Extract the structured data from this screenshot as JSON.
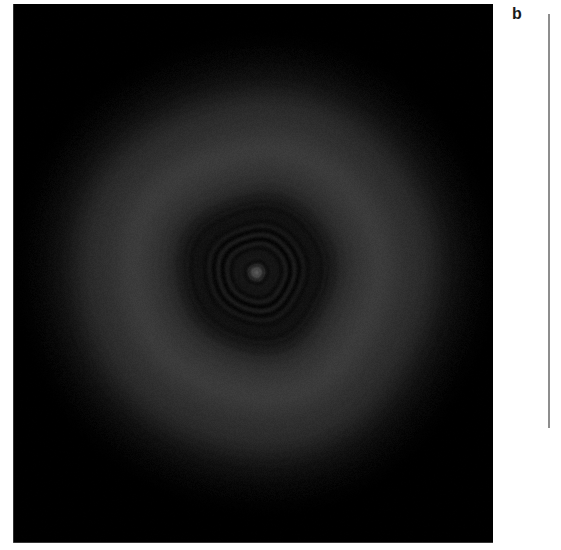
{
  "figure": {
    "panel_letter": "b",
    "caption_text": "",
    "background_color": "#ffffff"
  },
  "image_panel": {
    "name": "diffraction-pattern",
    "background_color": "#000000",
    "x": 13,
    "y": 4,
    "width": 480,
    "height": 539
  },
  "vertical_rule": {
    "color": "#8d8d8d",
    "x": 548,
    "y": 14,
    "width": 2,
    "height": 414
  },
  "chart_data": {
    "type": "heatmap",
    "title": "",
    "subtitle": "",
    "xlabel": "",
    "ylabel": "",
    "annotations": [
      "b"
    ],
    "legend": [],
    "grid": false,
    "colormap": "grayscale",
    "value_range": [
      0,
      255
    ],
    "center": {
      "x": 256,
      "y": 272
    },
    "radial_profile": {
      "radius": [
        0,
        4,
        7,
        10,
        14,
        18,
        22,
        26,
        30,
        34,
        38,
        42,
        46,
        50,
        54,
        58,
        62,
        66,
        70,
        78,
        86,
        94,
        102,
        110,
        118,
        126,
        134,
        142,
        150,
        158,
        166,
        174,
        182,
        190,
        198,
        206,
        214,
        222,
        232,
        245
      ],
      "intensity": [
        78,
        72,
        40,
        16,
        26,
        13,
        24,
        12,
        22,
        11,
        21,
        12,
        20,
        13,
        19,
        14,
        20,
        16,
        22,
        30,
        40,
        48,
        54,
        57,
        58,
        57,
        55,
        53,
        50,
        46,
        41,
        35,
        29,
        23,
        17,
        12,
        8,
        5,
        2,
        0
      ]
    },
    "rings": [
      {
        "name": "central-spot",
        "radius": 6,
        "intensity": 76
      },
      {
        "name": "ring-1",
        "radius": 13,
        "intensity": 27
      },
      {
        "name": "ring-2",
        "radius": 23,
        "intensity": 25
      },
      {
        "name": "ring-3",
        "radius": 33,
        "intensity": 23
      },
      {
        "name": "ring-4",
        "radius": 43,
        "intensity": 21
      },
      {
        "name": "ring-5",
        "radius": 53,
        "intensity": 20
      },
      {
        "name": "ring-6",
        "radius": 63,
        "intensity": 21
      },
      {
        "name": "amorphous-halo",
        "radius": 120,
        "intensity": 58
      },
      {
        "name": "halo-outer-edge",
        "radius": 205,
        "intensity": 4
      }
    ],
    "noise": {
      "type": "grain",
      "amplitude": 7
    }
  }
}
